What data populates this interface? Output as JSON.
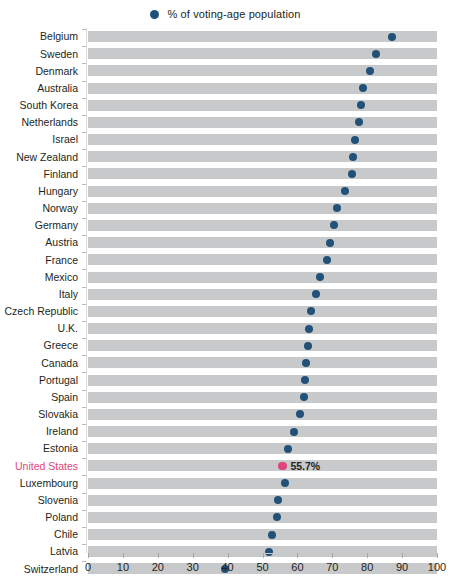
{
  "legend": {
    "marker_color": "#215178",
    "label": "% of voting-age population"
  },
  "highlight": {
    "country": "United States",
    "color": "#e0457b",
    "value_label": "55.7%"
  },
  "axis": {
    "ticks": [
      "0",
      "10",
      "20",
      "30",
      "40",
      "50",
      "60",
      "70",
      "80",
      "90",
      "100"
    ]
  },
  "chart_data": {
    "type": "bar",
    "title": "",
    "subtitle": "",
    "xlabel": "",
    "ylabel": "",
    "xlim": [
      0,
      100
    ],
    "grid": false,
    "legend_position": "top-center",
    "series_name": "% of voting-age population",
    "categories": [
      "Belgium",
      "Sweden",
      "Denmark",
      "Australia",
      "South Korea",
      "Netherlands",
      "Israel",
      "New Zealand",
      "Finland",
      "Hungary",
      "Norway",
      "Germany",
      "Austria",
      "France",
      "Mexico",
      "Italy",
      "Czech Republic",
      "U.K.",
      "Greece",
      "Canada",
      "Portugal",
      "Spain",
      "Slovakia",
      "Ireland",
      "Estonia",
      "United States",
      "Luxembourg",
      "Slovenia",
      "Poland",
      "Chile",
      "Latvia",
      "Switzerland"
    ],
    "values": [
      87.2,
      82.6,
      80.8,
      78.9,
      78.2,
      77.7,
      76.4,
      76.0,
      75.7,
      73.6,
      71.4,
      70.5,
      69.3,
      68.5,
      66.4,
      65.3,
      63.9,
      63.3,
      63.0,
      62.6,
      62.3,
      61.9,
      60.8,
      59.0,
      57.4,
      55.7,
      56.4,
      54.4,
      54.2,
      52.7,
      51.9,
      39.3
    ],
    "data_labels": {
      "United States": "55.7%"
    }
  }
}
